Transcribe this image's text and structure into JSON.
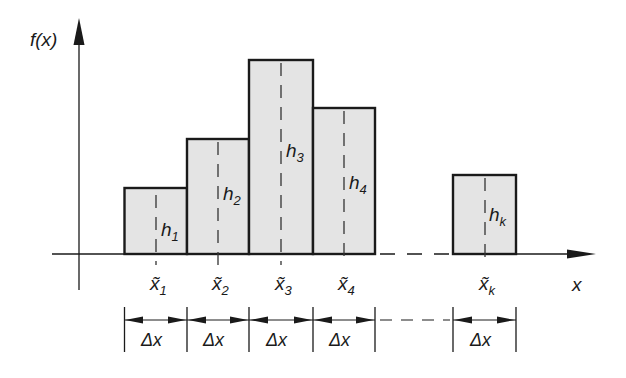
{
  "diagram": {
    "y_axis_label": "f(x)",
    "x_axis_label": "x",
    "colors": {
      "bar_fill": "#e4e4e4",
      "stroke": "#1a1a1a",
      "background": "#ffffff"
    },
    "bars": [
      {
        "height_label": "h",
        "height_sub": "1",
        "center_label": "x̃",
        "center_sub": "1",
        "width_label": "Δx"
      },
      {
        "height_label": "h",
        "height_sub": "2",
        "center_label": "x̃",
        "center_sub": "2",
        "width_label": "Δx"
      },
      {
        "height_label": "h",
        "height_sub": "3",
        "center_label": "x̃",
        "center_sub": "3",
        "width_label": "Δx"
      },
      {
        "height_label": "h",
        "height_sub": "4",
        "center_label": "x̃",
        "center_sub": "4",
        "width_label": "Δx"
      },
      {
        "height_label": "h",
        "height_sub": "k",
        "center_label": "x̃",
        "center_sub": "k",
        "width_label": "Δx"
      }
    ]
  }
}
